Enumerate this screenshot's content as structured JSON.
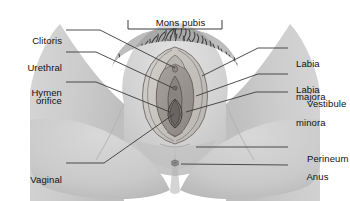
{
  "figure": {
    "width": 350,
    "height": 201,
    "background_color": "#ffffff",
    "line_color": "#3a3a3a",
    "text_color": "#111111"
  },
  "colors": {
    "background": "#ffffff",
    "skin_light": "#dcdcdc",
    "skin_mid": "#cfcfcf",
    "skin_shadow": "#bdbdbd",
    "skin_deep_shadow": "#ababab",
    "labia_majora": "#c8c4c0",
    "labia_minora": "#9a9490",
    "vestibule": "#8a8480",
    "pubic_hair": "#4a4a4a",
    "leader_line": "#3a3a3a",
    "text": "#111111"
  },
  "labels": {
    "left": [
      {
        "id": "clitoris",
        "text": "Clitoris",
        "lines": [
          "Clitoris"
        ]
      },
      {
        "id": "urethral-orifice",
        "text": "Urethral orifice",
        "lines": [
          "Urethral",
          "orifice"
        ]
      },
      {
        "id": "hymen",
        "text": "Hymen",
        "lines": [
          "Hymen"
        ]
      },
      {
        "id": "vaginal-orifice",
        "text": "Vaginal orifice",
        "lines": [
          "Vaginal",
          "orifice"
        ]
      }
    ],
    "right": [
      {
        "id": "labia-majora",
        "text": "Labia majora",
        "lines": [
          "Labia",
          "majora"
        ]
      },
      {
        "id": "labia-minora",
        "text": "Labia minora",
        "lines": [
          "Labia",
          "minora"
        ]
      },
      {
        "id": "vestibule",
        "text": "Vestibule",
        "lines": [
          "Vestibule"
        ]
      },
      {
        "id": "perineum",
        "text": "Perineum",
        "lines": [
          "Perineum"
        ]
      },
      {
        "id": "anus",
        "text": "Anus",
        "lines": [
          "Anus"
        ]
      }
    ],
    "top": [
      {
        "id": "mons-pubis",
        "text": "Mons pubis",
        "lines": [
          "Mons pubis"
        ],
        "has_bracket": true
      }
    ]
  },
  "text": {
    "clitoris": "Clitoris",
    "urethral_l1": "Urethral",
    "urethral_l2": "orifice",
    "hymen": "Hymen",
    "vaginal_l1": "Vaginal",
    "vaginal_l2": "orifice",
    "mons_pubis": "Mons pubis",
    "labia_majora_l1": "Labia",
    "labia_majora_l2": "majora",
    "labia_minora_l1": "Labia",
    "labia_minora_l2": "minora",
    "vestibule": "Vestibule",
    "perineum": "Perineum",
    "anus": "Anus"
  }
}
